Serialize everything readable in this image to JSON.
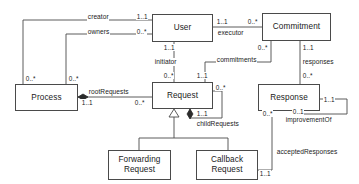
{
  "diagram": {
    "type": "uml-class-diagram",
    "title": "",
    "canvas": {
      "width": 359,
      "height": 184
    },
    "colors": {
      "line": "#4a4a4a",
      "box_border": "#4a4a4a",
      "box_fill": "#ffffff",
      "text": "#1a1a1a",
      "background": "#ffffff"
    },
    "classes": [
      {
        "id": "user",
        "name": "User",
        "x": 152,
        "y": 14,
        "w": 61,
        "h": 28
      },
      {
        "id": "commitment",
        "name": "Commitment",
        "x": 262,
        "y": 13,
        "w": 69,
        "h": 28
      },
      {
        "id": "process",
        "name": "Process",
        "x": 15,
        "y": 84,
        "w": 63,
        "h": 27
      },
      {
        "id": "request",
        "name": "Request",
        "x": 152,
        "y": 82,
        "w": 61,
        "h": 27
      },
      {
        "id": "response",
        "name": "Response",
        "x": 258,
        "y": 84,
        "w": 62,
        "h": 27
      },
      {
        "id": "forwarding-request",
        "name": "Forwarding\nRequest",
        "x": 108,
        "y": 150,
        "w": 63,
        "h": 30
      },
      {
        "id": "callback-request",
        "name": "Callback\nRequest",
        "x": 196,
        "y": 150,
        "w": 62,
        "h": 30
      }
    ],
    "associations": [
      {
        "id": "creator",
        "label": "creator",
        "from": "process",
        "to": "user",
        "from_multiplicity": "0..*",
        "to_multiplicity": "1..1",
        "kind": "association"
      },
      {
        "id": "owners",
        "label": "owners",
        "from": "process",
        "to": "user",
        "from_multiplicity": "0..*",
        "to_multiplicity": "0..*",
        "kind": "association"
      },
      {
        "id": "executor",
        "label": "executor",
        "from": "user",
        "to": "commitment",
        "from_multiplicity": "1..1",
        "to_multiplicity": "0..*",
        "kind": "association"
      },
      {
        "id": "initiator",
        "label": "initiator",
        "from": "user",
        "to": "request",
        "from_multiplicity": "1..1",
        "to_multiplicity": "0..*",
        "kind": "association"
      },
      {
        "id": "commitments",
        "label": "commitments",
        "from": "commitment",
        "to": "request",
        "from_multiplicity": "0..*",
        "to_multiplicity": "1..1",
        "kind": "association"
      },
      {
        "id": "root-requests",
        "label": "rootRequests",
        "from": "process",
        "to": "request",
        "from_multiplicity": "1..1",
        "to_multiplicity": "0..*",
        "kind": "composition"
      },
      {
        "id": "child-requests",
        "label": "childRequests",
        "from": "request",
        "to": "request",
        "from_multiplicity": "1..1",
        "to_multiplicity": "0..*",
        "kind": "composition-self"
      },
      {
        "id": "responses",
        "label": "responses",
        "from": "commitment",
        "to": "response",
        "from_multiplicity": "1..1",
        "to_multiplicity": "0..*",
        "kind": "association"
      },
      {
        "id": "improvement-of",
        "label": "improvementOf",
        "from": "response",
        "to": "response",
        "from_multiplicity": "1..1",
        "to_multiplicity": "0..1",
        "kind": "association-self"
      },
      {
        "id": "accepted-responses",
        "label": "acceptedResponses",
        "from": "callback-request",
        "to": "response",
        "from_multiplicity": "1..1",
        "to_multiplicity": "0..*",
        "kind": "association"
      }
    ],
    "generalizations": [
      {
        "id": "gen-forwarding",
        "sub": "forwarding-request",
        "super": "request"
      },
      {
        "id": "gen-callback",
        "sub": "callback-request",
        "super": "request"
      }
    ]
  },
  "labels": {
    "creator": "creator",
    "owners": "owners",
    "executor": "executor",
    "initiator": "initiator",
    "commitments": "commitments",
    "root_requests": "rootRequests",
    "child_requests": "childRequests",
    "responses": "responses",
    "improvement_of": "improvementOf",
    "accepted_responses": "acceptedResponses"
  },
  "multiplicities": {
    "creator_user": "1..1",
    "creator_process": "0..*",
    "owners_user": "0..*",
    "owners_process": "0..*",
    "executor_user": "1..1",
    "executor_commitment": "0..*",
    "initiator_user": "1..1",
    "initiator_request": "0..*",
    "commitments_commitment": "0..*",
    "commitments_request": "1..1",
    "root_process": "1..1",
    "root_request": "0..*",
    "child_top": "0..*",
    "child_bottom": "1..1",
    "responses_commitment": "1..1",
    "responses_response": "0..*",
    "improvement_right": "1..1",
    "improvement_bottom": "0..1",
    "accepted_response": "0..*",
    "accepted_callback": "1..1"
  },
  "class_names": {
    "user": "User",
    "commitment": "Commitment",
    "process": "Process",
    "request": "Request",
    "response": "Response",
    "forwarding_request": "Forwarding\nRequest",
    "callback_request": "Callback\nRequest"
  }
}
